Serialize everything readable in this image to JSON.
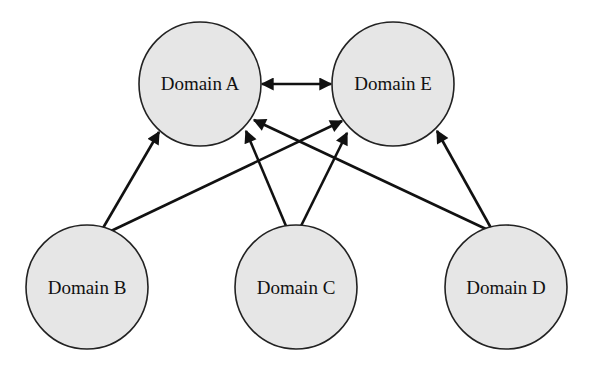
{
  "diagram": {
    "type": "directed-graph",
    "nodes": [
      {
        "id": "A",
        "label": "Domain A",
        "cx": 200,
        "cy": 84,
        "rx": 61,
        "ry": 62
      },
      {
        "id": "E",
        "label": "Domain E",
        "cx": 393,
        "cy": 84,
        "rx": 61,
        "ry": 62
      },
      {
        "id": "B",
        "label": "Domain B",
        "cx": 87,
        "cy": 287,
        "rx": 61,
        "ry": 62
      },
      {
        "id": "C",
        "label": "Domain C",
        "cx": 296,
        "cy": 287,
        "rx": 61,
        "ry": 62
      },
      {
        "id": "D",
        "label": "Domain D",
        "cx": 506,
        "cy": 287,
        "rx": 61,
        "ry": 62
      }
    ],
    "edges": [
      {
        "from": "A",
        "to": "E",
        "bidirectional": true
      },
      {
        "from": "B",
        "to": "A"
      },
      {
        "from": "B",
        "to": "E"
      },
      {
        "from": "C",
        "to": "A"
      },
      {
        "from": "C",
        "to": "E"
      },
      {
        "from": "D",
        "to": "A"
      },
      {
        "from": "D",
        "to": "E"
      }
    ]
  }
}
